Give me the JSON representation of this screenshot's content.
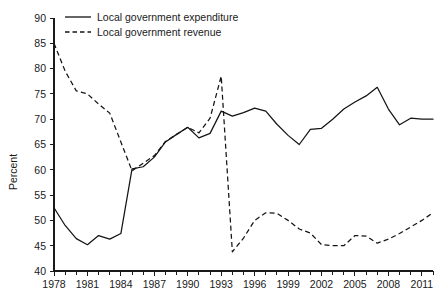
{
  "chart_data": {
    "type": "line",
    "title": "",
    "xlabel": "",
    "ylabel": "Percent",
    "ylim": [
      40,
      90
    ],
    "xlim": [
      1978,
      2012
    ],
    "grid": false,
    "legend_position": "top-left",
    "ytick_labels": [
      "40",
      "45",
      "50",
      "55",
      "60",
      "65",
      "70",
      "75",
      "80",
      "85",
      "90"
    ],
    "ytick_values": [
      40,
      45,
      50,
      55,
      60,
      65,
      70,
      75,
      80,
      85,
      90
    ],
    "xtick_values": [
      1978,
      1979,
      1980,
      1981,
      1982,
      1983,
      1984,
      1985,
      1986,
      1987,
      1988,
      1989,
      1990,
      1991,
      1992,
      1993,
      1994,
      1995,
      1996,
      1997,
      1998,
      1999,
      2000,
      2001,
      2002,
      2003,
      2004,
      2005,
      2006,
      2007,
      2008,
      2009,
      2010,
      2011,
      2012
    ],
    "xtick_labels": [
      "1978",
      "1981",
      "1984",
      "1987",
      "1990",
      "1993",
      "1996",
      "1999",
      "2002",
      "2005",
      "2008",
      "2011"
    ],
    "xtick_labeled_values": [
      1978,
      1981,
      1984,
      1987,
      1990,
      1993,
      1996,
      1999,
      2002,
      2005,
      2008,
      2011
    ],
    "x": [
      1978,
      1979,
      1980,
      1981,
      1982,
      1983,
      1984,
      1985,
      1986,
      1987,
      1988,
      1989,
      1990,
      1991,
      1992,
      1993,
      1994,
      1995,
      1996,
      1997,
      1998,
      1999,
      2000,
      2001,
      2002,
      2003,
      2004,
      2005,
      2006,
      2007,
      2008,
      2009,
      2010,
      2011,
      2012
    ],
    "series": [
      {
        "name": "Local government expenditure",
        "style": "solid",
        "values": [
          52.5,
          49.0,
          46.4,
          45.2,
          47.0,
          46.3,
          47.4,
          60.2,
          60.6,
          62.5,
          65.5,
          67.0,
          68.4,
          66.3,
          67.2,
          71.6,
          70.6,
          71.3,
          72.2,
          71.6,
          69.0,
          66.8,
          65.0,
          68.0,
          68.2,
          70.0,
          72.0,
          73.4,
          74.6,
          76.3,
          72.0,
          68.9,
          70.2,
          70.0,
          70.0
        ]
      },
      {
        "name": "Local government revenue",
        "style": "dashed",
        "values": [
          85.0,
          79.5,
          75.6,
          75.0,
          73.0,
          71.2,
          65.5,
          59.8,
          61.3,
          62.8,
          65.6,
          67.0,
          68.4,
          67.3,
          70.2,
          78.5,
          43.8,
          46.5,
          50.0,
          51.5,
          51.4,
          50.0,
          48.3,
          47.5,
          45.2,
          45.0,
          45.0,
          47.0,
          46.9,
          45.5,
          46.3,
          47.4,
          48.7,
          50.0,
          51.5
        ]
      }
    ],
    "legend": [
      {
        "label": "Local government expenditure",
        "style": "solid"
      },
      {
        "label": "Local government revenue",
        "style": "dashed"
      }
    ]
  }
}
